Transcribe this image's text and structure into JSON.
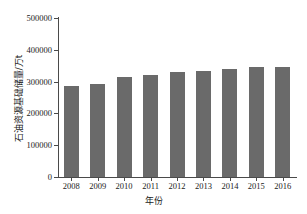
{
  "chart_data": {
    "type": "bar",
    "title": "",
    "subtitle": "",
    "xlabel": "年份",
    "ylabel": "石油资源基础储量/万t",
    "categories": [
      "2008",
      "2009",
      "2010",
      "2011",
      "2012",
      "2013",
      "2014",
      "2015",
      "2016"
    ],
    "values": [
      287000,
      293000,
      315000,
      322000,
      331000,
      334000,
      340000,
      346000,
      347000
    ],
    "series": [
      {
        "name": "石油资源基础储量",
        "values": [
          287000,
          293000,
          315000,
          322000,
          331000,
          334000,
          340000,
          346000,
          347000
        ]
      }
    ],
    "ylim": [
      0,
      500000
    ],
    "yticks": [
      0,
      100000,
      200000,
      300000,
      400000,
      500000
    ],
    "ytick_labels": [
      "0",
      "100000",
      "200000",
      "300000",
      "400000",
      "500000"
    ],
    "xtick_labels": [
      "2008",
      "2009",
      "2010",
      "2011",
      "2012",
      "2013",
      "2014",
      "2015",
      "2016"
    ],
    "grid": false,
    "legend": false,
    "legend_position": "none",
    "bar_color": "#6a6a6a",
    "axis_color": "#4a4a4a",
    "background_color": "#ffffff",
    "text_color": "#1b1b1b"
  }
}
